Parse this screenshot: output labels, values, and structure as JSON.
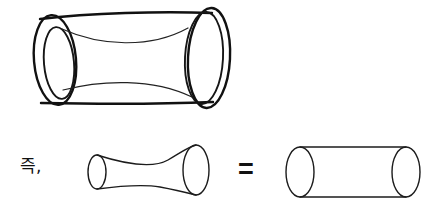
{
  "figure": {
    "background_color": "#ffffff",
    "stroke_color": "#111111",
    "width": 435,
    "height": 206
  },
  "labels": {
    "therefore": "즉,",
    "equals": "="
  },
  "shapes": {
    "top_tube": {
      "name": "thick-walled-tube-with-waist",
      "description": "Large tilted open tube drawn with annular rings at both ends and an inner waisted (hyperboloid) surface",
      "left_ring": {
        "outer": {
          "cx": 55,
          "cy": 60,
          "rx": 20,
          "ry": 45,
          "rotate": -6
        },
        "inner": {
          "cx": 59,
          "cy": 63,
          "rx": 15,
          "ry": 36,
          "rotate": -6
        }
      },
      "right_ring": {
        "outer": {
          "cx": 208,
          "cy": 58,
          "rx": 22,
          "ry": 51,
          "rotate": 3
        },
        "inner": {
          "cx": 205,
          "cy": 58,
          "rx": 19,
          "ry": 46,
          "rotate": 3
        }
      }
    },
    "waist_tube": {
      "name": "waisted-tube",
      "description": "Hyperboloid-like tube pinched at the middle",
      "left_ellipse": {
        "cx": 97,
        "cy": 172,
        "rx": 9,
        "ry": 17
      },
      "right_ellipse": {
        "cx": 196,
        "cy": 170,
        "rx": 13,
        "ry": 25
      }
    },
    "plain_cylinder": {
      "name": "plain-cylinder",
      "description": "Straight cylinder with equal circular ends",
      "left_ellipse": {
        "cx": 300,
        "cy": 172,
        "rx": 14,
        "ry": 25
      },
      "right_ellipse": {
        "cx": 406,
        "cy": 172,
        "rx": 14,
        "ry": 25
      }
    }
  }
}
